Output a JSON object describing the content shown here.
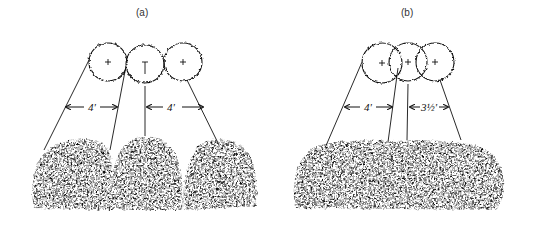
{
  "figure": {
    "colors": {
      "ink": "#111111",
      "paper": "#ffffff",
      "label": "#333333"
    }
  },
  "panels": [
    {
      "id": "a",
      "label": "(a)",
      "plants": 3,
      "arrangement": "touching canopies",
      "dimensions": [
        {
          "label": "4'",
          "meaning": "spacing between left and center plant"
        },
        {
          "label": "4'",
          "meaning": "spacing between center and right plant"
        }
      ]
    },
    {
      "id": "b",
      "label": "(b)",
      "plants": 3,
      "arrangement": "overlapping canopies",
      "dimensions": [
        {
          "label": "4'",
          "meaning": "spacing between left and center plant"
        },
        {
          "label": "3½'",
          "meaning": "spacing between center and right plant"
        }
      ]
    }
  ]
}
